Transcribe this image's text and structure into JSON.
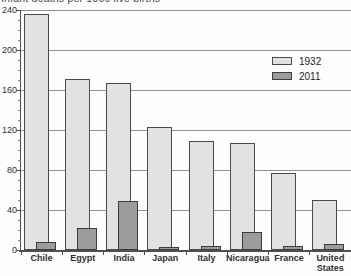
{
  "title": "Infant deaths per 1000 live births",
  "colors": {
    "bar_1932_fill": "#e2e2e0",
    "bar_1932_border": "#4b4b4b",
    "bar_2011_fill": "#9c9c9a",
    "bar_2011_border": "#3c3c3c",
    "gridline": "#909090",
    "axis": "#4f4f4f",
    "text": "#2f2f2f"
  },
  "chart_data": {
    "type": "bar",
    "title": "Infant deaths per 1000 live births",
    "categories": [
      "Chile",
      "Egypt",
      "India",
      "Japan",
      "Italy",
      "Nicaragua",
      "France",
      "United States"
    ],
    "series": [
      {
        "name": "1932",
        "values": [
          236,
          171,
          167,
          123,
          109,
          107,
          77,
          50
        ]
      },
      {
        "name": "2011",
        "values": [
          8,
          22,
          49,
          3,
          4,
          18,
          4,
          6
        ]
      }
    ],
    "xlabel": "",
    "ylabel": "",
    "ylim": [
      0,
      240
    ],
    "yticks": [
      0,
      40,
      80,
      120,
      160,
      200,
      240
    ],
    "y_minor_tick_step": 10,
    "grid": true,
    "legend_position": "upper right",
    "bar_style": "overlapped"
  },
  "legend": {
    "items": [
      {
        "label": "1932"
      },
      {
        "label": "2011"
      }
    ]
  }
}
